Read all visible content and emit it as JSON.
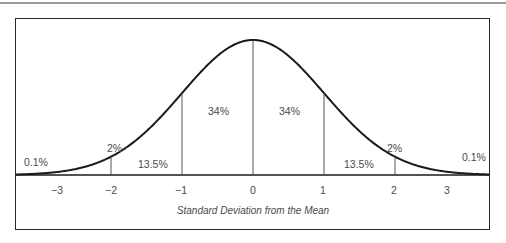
{
  "chart_data": {
    "type": "area",
    "title": "",
    "xlabel": "Standard Deviation from the Mean",
    "ylabel": "",
    "distribution": "normal",
    "x_ticks": [
      "−3",
      "−2",
      "−1",
      "0",
      "1",
      "2",
      "3"
    ],
    "x_tick_values": [
      -3,
      -2,
      -1,
      0,
      1,
      2,
      3
    ],
    "xlim": [
      -3.5,
      3.5
    ],
    "regions": [
      {
        "range": "< -3",
        "label": "0.1%"
      },
      {
        "range": "-3 to -2",
        "label": "2%"
      },
      {
        "range": "-2 to -1",
        "label": "13.5%"
      },
      {
        "range": "-1 to 0",
        "label": "34%"
      },
      {
        "range": "0 to 1",
        "label": "34%"
      },
      {
        "range": "1 to 2",
        "label": "13.5%"
      },
      {
        "range": "2 to 3",
        "label": "2%"
      },
      {
        "range": "> 3",
        "label": "0.1%"
      }
    ],
    "values": [
      0.1,
      2,
      13.5,
      34,
      34,
      13.5,
      2,
      0.1
    ],
    "categories": [
      "< -3",
      "-3 to -2",
      "-2 to -1",
      "-1 to 0",
      "0 to 1",
      "1 to 2",
      "2 to 3",
      "> 3"
    ],
    "grid": false,
    "legend": "none"
  },
  "labels": {
    "left_tail": "0.1%",
    "left_2pct": "2%",
    "left_13": "13.5%",
    "left_34": "34%",
    "right_34": "34%",
    "right_13": "13.5%",
    "right_2pct": "2%",
    "right_tail": "0.1%"
  },
  "ticks": {
    "m3": "−3",
    "m2": "−2",
    "m1": "−1",
    "z": "0",
    "p1": "1",
    "p2": "2",
    "p3": "3"
  },
  "axis": {
    "title": "Standard Deviation from the Mean"
  }
}
